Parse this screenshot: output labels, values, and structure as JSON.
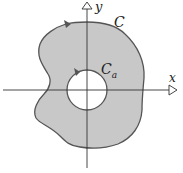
{
  "diagram": {
    "title": "",
    "labels": {
      "x_axis": "x",
      "y_axis": "y",
      "outer_curve": "C",
      "inner_curve_main": "C",
      "inner_curve_sub": "a"
    },
    "colors": {
      "region_fill": "#c8c8c8",
      "curve_stroke": "#555555",
      "axis_stroke": "#333333",
      "background": "#ffffff"
    },
    "elements": [
      {
        "type": "axis",
        "name": "x-axis",
        "direction": "horizontal"
      },
      {
        "type": "axis",
        "name": "y-axis",
        "direction": "vertical"
      },
      {
        "type": "closed-curve",
        "name": "outer-curve-C",
        "orientation": "counterclockwise"
      },
      {
        "type": "circle",
        "name": "inner-circle-Ca",
        "center": "origin",
        "orientation": "counterclockwise"
      },
      {
        "type": "shaded-region",
        "name": "annular-region",
        "between": [
          "C",
          "Ca"
        ]
      }
    ]
  }
}
